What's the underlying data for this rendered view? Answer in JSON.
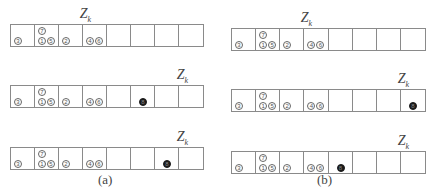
{
  "label": "Z",
  "label_sub": "k",
  "panels": [
    {
      "caption": "(a)",
      "rows": [
        {
          "z_cell": 3,
          "dark_ball": null
        },
        {
          "z_cell": 7,
          "dark_ball": {
            "cell": 5,
            "label": "8"
          }
        },
        {
          "z_cell": 7,
          "dark_ball": {
            "cell": 6,
            "label": "8"
          }
        }
      ]
    },
    {
      "caption": "(b)",
      "rows": [
        {
          "z_cell": 3,
          "dark_ball": null
        },
        {
          "z_cell": 7,
          "dark_ball": {
            "cell": 7,
            "label": "8"
          }
        },
        {
          "z_cell": 7,
          "dark_ball": {
            "cell": 4,
            "label": "8"
          }
        }
      ]
    }
  ],
  "cells_per_row": 8,
  "base_balls": [
    {
      "cell": 0,
      "label": "3",
      "pos": "bottom-left"
    },
    {
      "cell": 1,
      "label": "7",
      "pos": "top-left"
    },
    {
      "cell": 1,
      "label": "1",
      "pos": "bottom-left"
    },
    {
      "cell": 1,
      "label": "5",
      "pos": "bottom-right"
    },
    {
      "cell": 2,
      "label": "2",
      "pos": "bottom-left"
    },
    {
      "cell": 3,
      "label": "4",
      "pos": "bottom-left"
    },
    {
      "cell": 3,
      "label": "6",
      "pos": "bottom-right"
    }
  ]
}
